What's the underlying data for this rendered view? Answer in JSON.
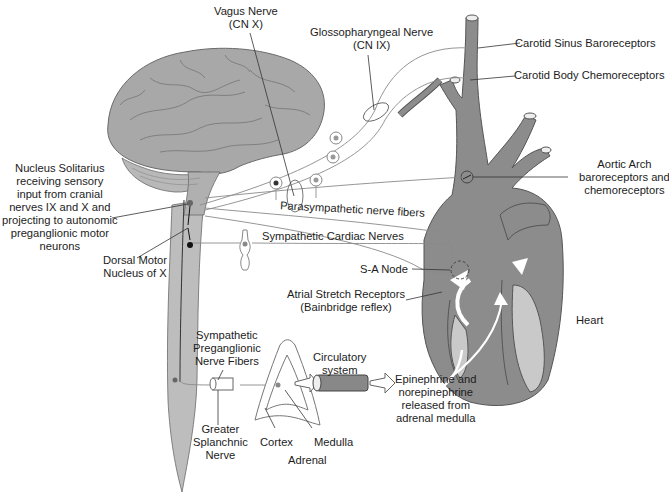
{
  "diagram": {
    "colors": {
      "tissue": "#8e8e8e",
      "tissue_light": "#b5b5b5",
      "brain": "#a9a9a9",
      "outline": "#555555",
      "nerve": "#8a8a8a",
      "text": "#1c1c1c"
    },
    "labels": {
      "vagus": [
        "Vagus Nerve",
        "(CN X)"
      ],
      "glosso": [
        "Glossopharyngeal Nerve",
        "(CN IX)"
      ],
      "carotid_sinus": "Carotid Sinus Baroreceptors",
      "carotid_body": "Carotid Body Chemoreceptors",
      "aortic_arch": [
        "Aortic Arch",
        "baroreceptors and",
        "chemoreceptors"
      ],
      "nucleus_solitarius": [
        "Nucleus Solitarius",
        "receiving sensory",
        "input from cranial",
        "nerves IX and X and",
        "projecting to autonomic",
        "preganglionic motor",
        "neurons"
      ],
      "parasympathetic": "Parasympathetic nerve fibers",
      "sympathetic_cardiac": "Sympathetic  Cardiac Nerves",
      "dorsal_motor": [
        "Dorsal Motor",
        "Nucleus of X"
      ],
      "sa_node": "S-A Node",
      "atrial_stretch": [
        "Atrial Stretch Receptors",
        "(Bainbridge reflex)"
      ],
      "heart": "Heart",
      "symp_preganglionic": [
        "Sympathetic",
        "Preganglionic",
        "Nerve Fibers"
      ],
      "circulatory": [
        "Circulatory",
        "system"
      ],
      "epinephrine": [
        "Epinephrine and",
        "norepinephrine",
        "released from",
        "adrenal medulla"
      ],
      "greater_splanchnic": [
        "Greater",
        "Splanchnic",
        "Nerve"
      ],
      "cortex": "Cortex",
      "medulla": "Medulla",
      "adrenal": "Adrenal"
    }
  }
}
